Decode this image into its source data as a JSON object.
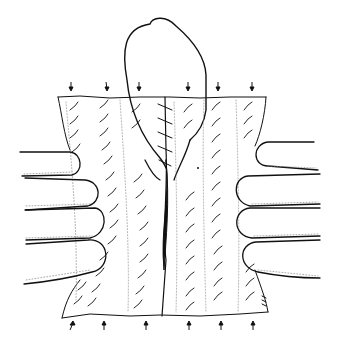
{
  "illustration": {
    "subject": "surgical line drawing: tissue edges held by fingers on both sides with central suture",
    "colors": {
      "background": "#ffffff",
      "ink": "#111111",
      "stipple": "#8a8a8a"
    },
    "arrows_top_count": 6,
    "arrows_bottom_count": 6
  }
}
